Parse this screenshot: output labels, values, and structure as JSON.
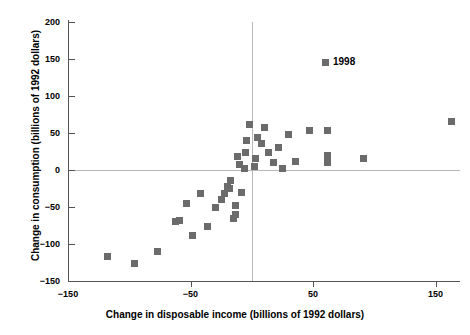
{
  "chart_data": {
    "type": "scatter",
    "title": "",
    "xlabel": "Change in disposable income (billions of 1992 dollars)",
    "ylabel": "Change in consumption (billions of 1992 dollars)",
    "xlim": [
      -150,
      170
    ],
    "ylim": [
      -150,
      200
    ],
    "xticks": [
      -150,
      -50,
      50,
      150
    ],
    "yticks": [
      -150,
      -100,
      -50,
      0,
      50,
      100,
      150,
      200
    ],
    "xtick_labels": [
      "−150",
      "−50",
      "50",
      "150"
    ],
    "ytick_labels": [
      "−150",
      "−100",
      "−50",
      "0",
      "50",
      "100",
      "150",
      "200"
    ],
    "grid": false,
    "reference_lines": {
      "horizontal": 0,
      "vertical": 0
    },
    "legend": {
      "position": "top-right",
      "entries": [
        {
          "label": "1998",
          "color": "#6b6b6b",
          "marker": "square"
        }
      ]
    },
    "marker_color": "#6b6b6b",
    "series": [
      {
        "name": "1998",
        "points": [
          [
            -118,
            -117
          ],
          [
            -96,
            -126
          ],
          [
            -77,
            -110
          ],
          [
            -62,
            -70
          ],
          [
            -59,
            -68
          ],
          [
            -53,
            -45
          ],
          [
            -48,
            -88
          ],
          [
            -42,
            -32
          ],
          [
            -36,
            -77
          ],
          [
            -30,
            -50
          ],
          [
            -25,
            -40
          ],
          [
            -22,
            -32
          ],
          [
            -20,
            -22
          ],
          [
            -18,
            -25
          ],
          [
            -17,
            -14
          ],
          [
            -15,
            -65
          ],
          [
            -13,
            -48
          ],
          [
            -13,
            -60
          ],
          [
            -12,
            18
          ],
          [
            -10,
            8
          ],
          [
            -8,
            -30
          ],
          [
            -6,
            2
          ],
          [
            -5,
            24
          ],
          [
            -4,
            40
          ],
          [
            -2,
            62
          ],
          [
            2,
            5
          ],
          [
            3,
            16
          ],
          [
            5,
            44
          ],
          [
            8,
            36
          ],
          [
            10,
            57
          ],
          [
            14,
            24
          ],
          [
            18,
            10
          ],
          [
            22,
            30
          ],
          [
            25,
            2
          ],
          [
            30,
            48
          ],
          [
            36,
            12
          ],
          [
            47,
            54
          ],
          [
            62,
            54
          ],
          [
            62,
            20
          ],
          [
            62,
            10
          ],
          [
            91,
            16
          ],
          [
            163,
            65
          ]
        ]
      }
    ]
  }
}
